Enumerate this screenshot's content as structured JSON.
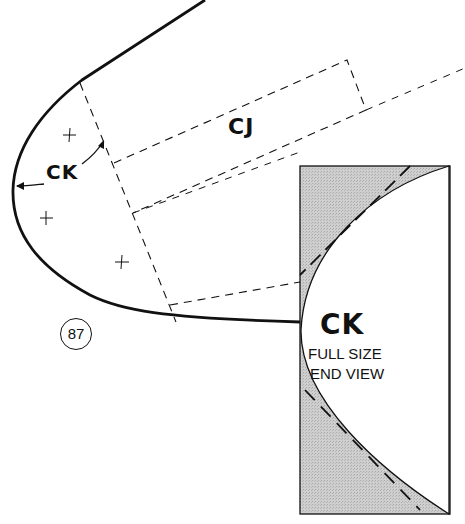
{
  "diagram": {
    "type": "pattern-template",
    "labels": {
      "cj": "CJ",
      "ck_side": "CK",
      "end_view_title": "CK",
      "end_view_line1": "FULL SIZE",
      "end_view_line2": "END VIEW"
    },
    "part_number": "87",
    "colors": {
      "ink": "#111111",
      "shade": "#c8c8c8",
      "background": "#ffffff"
    }
  }
}
